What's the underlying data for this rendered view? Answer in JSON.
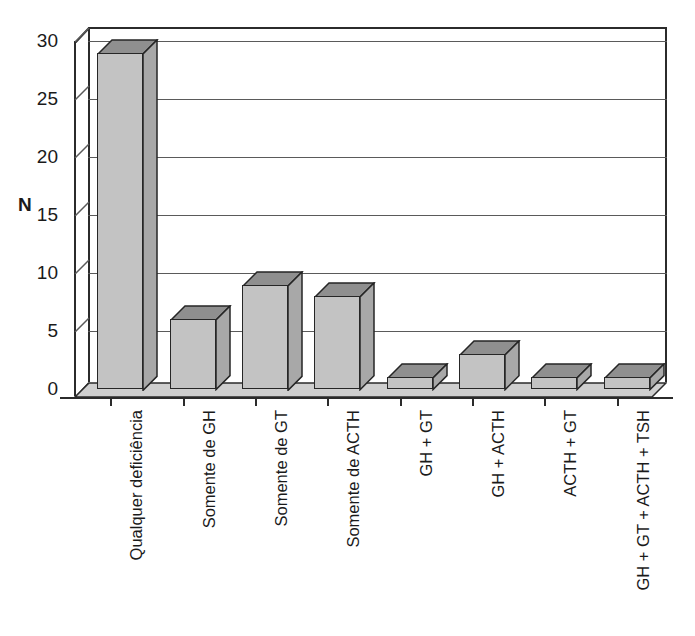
{
  "chart_data": {
    "type": "bar",
    "title": "",
    "subtitle": "",
    "xlabel": "",
    "ylabel": "N",
    "ylim": [
      0,
      30
    ],
    "ytick_step": 5,
    "yticks": [
      "0",
      "5",
      "10",
      "15",
      "20",
      "25",
      "30"
    ],
    "grid": true,
    "legend": "none",
    "style": "3d-column",
    "categories": [
      "Qualquer deficiência",
      "Somente de GH",
      "Somente de GT",
      "Somente de ACTH",
      "GH + GT",
      "GH + ACTH",
      "ACTH + GT",
      "GH + GT + ACTH + TSH"
    ],
    "values": [
      29,
      6,
      9,
      8,
      1,
      3,
      1,
      1
    ],
    "series": [
      {
        "name": "N",
        "values": [
          29,
          6,
          9,
          8,
          1,
          3,
          1,
          1
        ]
      }
    ]
  },
  "colors": {
    "bar_front": "#c3c3c3",
    "bar_top": "#8f8f8f",
    "bar_side": "#a8a8a8",
    "bar_outline": "#262626",
    "gridline": "#5a5a5a",
    "axis": "#2b2b2b",
    "floor": "#cfcfcf",
    "background": "#ffffff",
    "text": "#1a1a1a"
  }
}
